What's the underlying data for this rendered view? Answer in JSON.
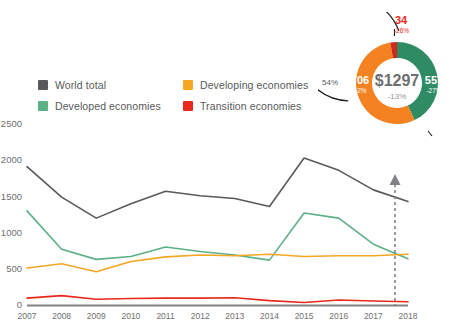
{
  "legend": {
    "items": [
      {
        "label": "World total",
        "color": "#58595b",
        "icon": "legend-swatch"
      },
      {
        "label": "Developing economies",
        "color": "#f5a623",
        "icon": "legend-swatch"
      },
      {
        "label": "Developed economies",
        "color": "#5cb085",
        "icon": "legend-swatch"
      },
      {
        "label": "Transition economies",
        "color": "#e8291c",
        "icon": "legend-swatch"
      }
    ]
  },
  "donut": {
    "center_value": "$1297",
    "center_change": "-13%",
    "outer_bracket_label": "54%",
    "segments": [
      {
        "name": "developed",
        "value": "557",
        "change": "-27%",
        "color": "#2e8b63",
        "share": 42.9
      },
      {
        "name": "transition",
        "value": "34",
        "change": "-26%",
        "color": "#cc2b20",
        "share": 2.6
      },
      {
        "name": "developing",
        "value": "706",
        "change": "+2%",
        "color": "#f58220",
        "share": 54.4
      }
    ],
    "arrow_icon": "arrow-up-icon"
  },
  "chart_data": {
    "type": "line",
    "title": "",
    "xlabel": "",
    "ylabel": "",
    "x": [
      2007,
      2008,
      2009,
      2010,
      2011,
      2012,
      2013,
      2014,
      2015,
      2016,
      2017,
      2018
    ],
    "categories": [
      "2007",
      "2008",
      "2009",
      "2010",
      "2011",
      "2012",
      "2013",
      "2014",
      "2015",
      "2016",
      "2017",
      "2018"
    ],
    "ylim": [
      0,
      2500
    ],
    "yticks": [
      0,
      500,
      1000,
      1500,
      2000,
      2500
    ],
    "ytick_labels": [
      "0",
      "500",
      "1000",
      "1500",
      "2000",
      "2500"
    ],
    "grid": false,
    "legend_position": "top-left",
    "series": [
      {
        "name": "World total",
        "color": "#58595b",
        "values": [
          1910,
          1490,
          1200,
          1400,
          1570,
          1510,
          1470,
          1360,
          2030,
          1860,
          1590,
          1430
        ]
      },
      {
        "name": "Developed economies",
        "color": "#5cb085",
        "values": [
          1300,
          770,
          630,
          670,
          800,
          740,
          690,
          620,
          1270,
          1200,
          840,
          640
        ]
      },
      {
        "name": "Developing economies",
        "color": "#f5a623",
        "values": [
          510,
          570,
          460,
          600,
          665,
          690,
          680,
          700,
          670,
          680,
          680,
          700
        ]
      },
      {
        "name": "Transition economies",
        "color": "#e8291c",
        "values": [
          95,
          130,
          80,
          90,
          95,
          95,
          100,
          60,
          35,
          70,
          55,
          45
        ]
      }
    ],
    "forecast_marker": {
      "x": 2018,
      "label": "",
      "style": "dashed-vertical-arrow",
      "color": "#808285"
    }
  }
}
